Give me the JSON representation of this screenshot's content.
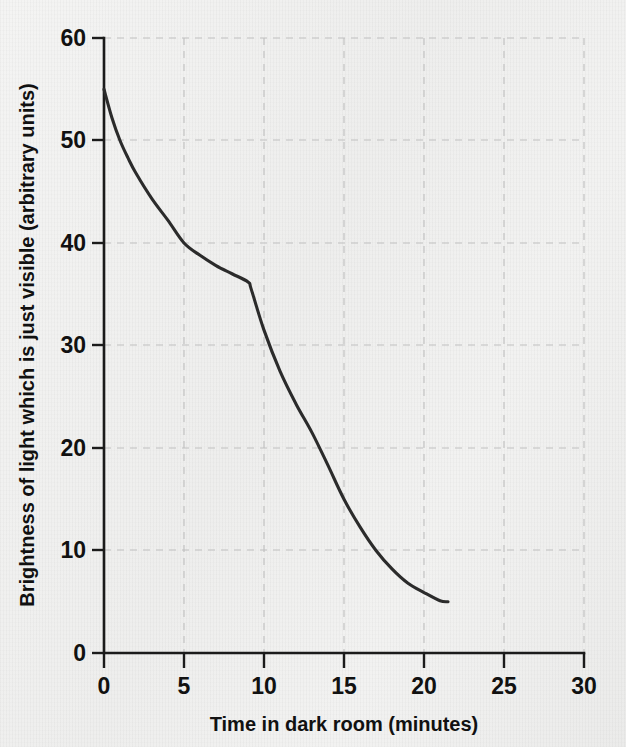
{
  "chart_data": {
    "type": "line",
    "title": "",
    "xlabel": "Time in dark room (minutes)",
    "ylabel": "Brightness of light which is just visible (arbitrary units)",
    "xlim": [
      0,
      30
    ],
    "ylim": [
      0,
      60
    ],
    "xticks": [
      "0",
      "5",
      "10",
      "15",
      "20",
      "25",
      "30"
    ],
    "yticks": [
      "0",
      "10",
      "20",
      "30",
      "40",
      "50",
      "60"
    ],
    "grid": "dashed-light-gray",
    "legend": "none",
    "series": [
      {
        "name": "Dark adaptation curve",
        "color": "#2b2b2b",
        "x": [
          0,
          0.5,
          1,
          1.5,
          2,
          3,
          4,
          5,
          6,
          7,
          8,
          9,
          9.2,
          10,
          11,
          12,
          13,
          14,
          15,
          16,
          17,
          18,
          19,
          20,
          21,
          21.5
        ],
        "y": [
          55,
          52.2,
          50,
          48.3,
          46.8,
          44.3,
          42.2,
          40,
          38.8,
          37.8,
          37,
          36.2,
          35.5,
          31.5,
          27.5,
          24.3,
          21.5,
          18.3,
          15,
          12.3,
          10,
          8.2,
          6.8,
          5.9,
          5.1,
          5
        ]
      }
    ],
    "annotations": [
      "Curve begins at 55 at time 0",
      "Rod-cone break (kink) at about 9 minutes, value about 36",
      "Curve plateaus at about 5 after roughly 21 minutes"
    ]
  },
  "geometry": {
    "plot_left": 104,
    "plot_right": 584,
    "plot_top": 38,
    "plot_bottom": 653
  }
}
